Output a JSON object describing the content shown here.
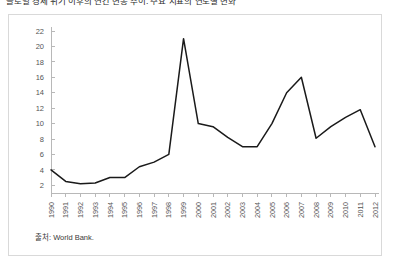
{
  "document": {
    "heading": "글로벌 경제 위기 이후의 연간 변동 추이: 주요 지표의 연도별 변화",
    "source_note": "출처: World Bank."
  },
  "chart_data": {
    "type": "line",
    "title": "",
    "subtitle": "",
    "xlabel": "",
    "ylabel": "",
    "grid": false,
    "legend": false,
    "line_color": "#1a1a1a",
    "axis_color": "#b8b8b8",
    "categories": [
      "1990",
      "1991",
      "1992",
      "1993",
      "1994",
      "1995",
      "1996",
      "1997",
      "1998",
      "1999",
      "2000",
      "2001",
      "2002",
      "2003",
      "2004",
      "2005",
      "2006",
      "2007",
      "2008",
      "2009",
      "2010",
      "2011",
      "2012"
    ],
    "values": [
      4.0,
      2.5,
      2.2,
      2.3,
      3.0,
      3.0,
      4.4,
      5.0,
      6.0,
      21.0,
      10.0,
      9.6,
      8.2,
      7.0,
      7.0,
      10.0,
      14.0,
      16.0,
      8.1,
      9.6,
      10.8,
      11.8,
      7.0
    ],
    "ylim": [
      1,
      22
    ],
    "yticks": [
      2,
      4,
      6,
      8,
      10,
      12,
      14,
      16,
      18,
      20,
      22
    ],
    "xtick_rotation": -90
  }
}
